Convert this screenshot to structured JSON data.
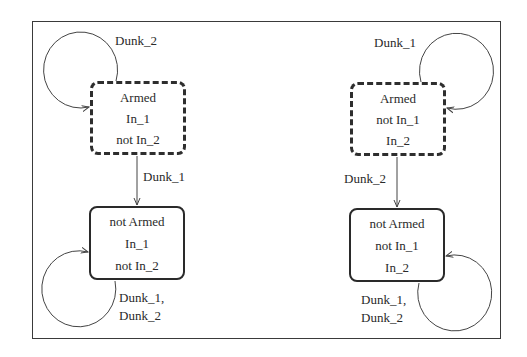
{
  "diagram": {
    "type": "state-machine",
    "frame": {
      "x": 32,
      "y": 21,
      "w": 469,
      "h": 318
    },
    "states": [
      {
        "id": "s1",
        "style": "initial",
        "x": 90,
        "y": 81,
        "w": 96,
        "h": 74,
        "lines": [
          "Armed",
          "In_1",
          "not In_2"
        ]
      },
      {
        "id": "s2",
        "style": "normal",
        "x": 89,
        "y": 206,
        "w": 96,
        "h": 74,
        "lines": [
          "not Armed",
          "In_1",
          "not In_2"
        ]
      },
      {
        "id": "s3",
        "style": "initial",
        "x": 350,
        "y": 82,
        "w": 96,
        "h": 74,
        "lines": [
          "Armed",
          "not In_1",
          "In_2"
        ]
      },
      {
        "id": "s4",
        "style": "normal",
        "x": 349,
        "y": 208,
        "w": 96,
        "h": 74,
        "lines": [
          "not Armed",
          "not In_1",
          "In_2"
        ]
      }
    ],
    "transitions": [
      {
        "from": "s1",
        "to": "s1",
        "label": "Dunk_2",
        "kind": "self-loop"
      },
      {
        "from": "s1",
        "to": "s2",
        "label": "Dunk_1",
        "kind": "straight"
      },
      {
        "from": "s2",
        "to": "s2",
        "label": "Dunk_1,\nDunk_2",
        "kind": "self-loop"
      },
      {
        "from": "s3",
        "to": "s3",
        "label": "Dunk_1",
        "kind": "self-loop"
      },
      {
        "from": "s3",
        "to": "s4",
        "label": "Dunk_2",
        "kind": "straight"
      },
      {
        "from": "s4",
        "to": "s4",
        "label": "Dunk_1,\nDunk_2",
        "kind": "self-loop"
      }
    ],
    "labels": {
      "t1": "Dunk_2",
      "t2": "Dunk_1",
      "t3a": "Dunk_1,",
      "t3b": "Dunk_2",
      "t4": "Dunk_1",
      "t5": "Dunk_2",
      "t6a": "Dunk_1,",
      "t6b": "Dunk_2"
    },
    "colors": {
      "stroke": "#2a2a2a",
      "text": "#2a2a2a",
      "background": "#ffffff"
    }
  }
}
